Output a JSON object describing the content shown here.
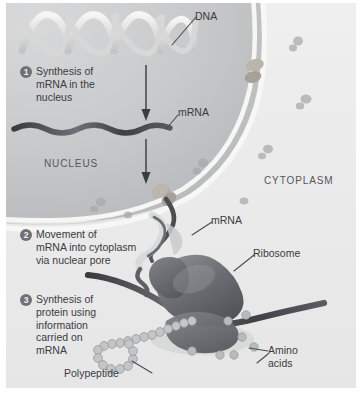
{
  "figure": {
    "background_color": "#ececed",
    "nucleus_color": "#c9cacb",
    "membrane_color": "#f4f4f2",
    "ribosome_color": "#6d6e72",
    "text_color": "#3b3b3f"
  },
  "steps": [
    {
      "number": "1",
      "text": "Synthesis of\nmRNA in the\nnucleus"
    },
    {
      "number": "2",
      "text": "Movement of\nmRNA into cytoplasm\nvia nuclear pore"
    },
    {
      "number": "3",
      "text": "Synthesis of\nprotein using\ninformation\ncarried on\nmRNA"
    }
  ],
  "labels": {
    "dna": "DNA",
    "mrna_nucleus": "mRNA",
    "nucleus": "NUCLEUS",
    "cytoplasm": "CYTOPLASM",
    "mrna_cytoplasm": "mRNA",
    "ribosome": "Ribosome",
    "polypeptide": "Polypeptide",
    "amino_acids": "Amino\nacids"
  }
}
